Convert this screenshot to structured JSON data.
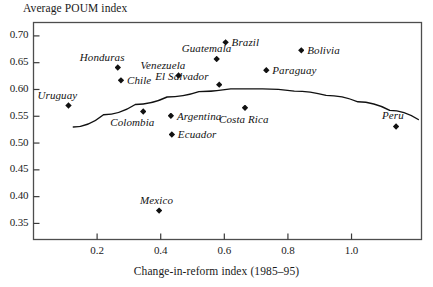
{
  "chart_data": {
    "type": "scatter",
    "title": "",
    "ylabel": "Average POUM index",
    "xlabel": "Change-in-reform index (1985–95)",
    "xlim": [
      0.0,
      1.22
    ],
    "ylim": [
      0.32,
      0.725
    ],
    "xticks": [
      0.2,
      0.4,
      0.6,
      0.8,
      1.0
    ],
    "xticklabels": [
      "0.2",
      "0.4",
      "0.6",
      "0.8",
      "1.0"
    ],
    "yticks": [
      0.35,
      0.4,
      0.45,
      0.5,
      0.55,
      0.6,
      0.65,
      0.7
    ],
    "yticklabels": [
      "0.35",
      "0.40",
      "0.45",
      "0.50",
      "0.55",
      "0.60",
      "0.65",
      "0.70"
    ],
    "grid": false,
    "legend": "none",
    "points": [
      {
        "label": "Uruguay",
        "x": 0.11,
        "y": 0.57,
        "label_dx": -31,
        "label_dy": -17
      },
      {
        "label": "Honduras",
        "x": 0.265,
        "y": 0.641,
        "label_dx": -38,
        "label_dy": -17
      },
      {
        "label": "Chile",
        "x": 0.275,
        "y": 0.617,
        "label_dx": 6,
        "label_dy": -6
      },
      {
        "label": "Colombia",
        "x": 0.345,
        "y": 0.559,
        "label_dx": -33,
        "label_dy": 5
      },
      {
        "label": "Mexico",
        "x": 0.395,
        "y": 0.374,
        "label_dx": -19,
        "label_dy": -17
      },
      {
        "label": "Argentina",
        "x": 0.432,
        "y": 0.551,
        "label_dx": 6,
        "label_dy": -6
      },
      {
        "label": "Ecuador",
        "x": 0.435,
        "y": 0.516,
        "label_dx": 6,
        "label_dy": -6
      },
      {
        "label": "Venezuela",
        "x": 0.456,
        "y": 0.626,
        "label_dx": -38,
        "label_dy": -17
      },
      {
        "label": "Guatemala",
        "x": 0.576,
        "y": 0.657,
        "label_dx": -35,
        "label_dy": -17
      },
      {
        "label": "Brazil",
        "x": 0.604,
        "y": 0.688,
        "label_dx": 6,
        "label_dy": -6
      },
      {
        "label": "El Salvador",
        "x": 0.584,
        "y": 0.609,
        "label_dx": -64,
        "label_dy": -15
      },
      {
        "label": "Costa Rica",
        "x": 0.665,
        "y": 0.566,
        "label_dx": -26,
        "label_dy": 5
      },
      {
        "label": "Paraguay",
        "x": 0.732,
        "y": 0.636,
        "label_dx": 6,
        "label_dy": -6
      },
      {
        "label": "Bolivia",
        "x": 0.842,
        "y": 0.673,
        "label_dx": 6,
        "label_dy": -6
      },
      {
        "label": "Peru",
        "x": 1.14,
        "y": 0.531,
        "label_dx": -14,
        "label_dy": -17
      }
    ],
    "fit_curve": {
      "type": "quadratic",
      "points": [
        [
          0.125,
          0.53
        ],
        [
          0.22,
          0.553
        ],
        [
          0.32,
          0.572
        ],
        [
          0.42,
          0.586
        ],
        [
          0.52,
          0.596
        ],
        [
          0.62,
          0.601
        ],
        [
          0.72,
          0.601
        ],
        [
          0.82,
          0.597
        ],
        [
          0.92,
          0.589
        ],
        [
          1.02,
          0.577
        ],
        [
          1.12,
          0.561
        ],
        [
          1.21,
          0.544
        ]
      ]
    }
  },
  "axes": {
    "frame_color": "#4d4d4d"
  }
}
